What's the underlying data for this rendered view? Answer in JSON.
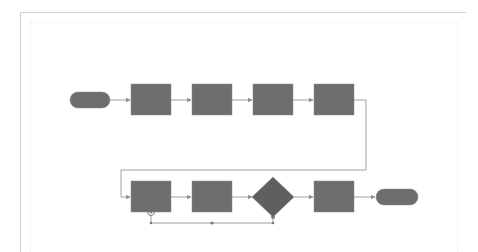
{
  "canvas": {
    "width": 478,
    "height": 243,
    "background": "#ffffff"
  },
  "colors": {
    "shape_fill": "#6e6e6e",
    "shape_stroke": "#8a8a8a",
    "connector": "#a0a0a0",
    "frame": "#cfcfcf",
    "handle": "#7a7a7a"
  },
  "diagram": {
    "type": "flowchart",
    "rows": [
      {
        "name": "row-1",
        "shapes": [
          {
            "id": "start",
            "kind": "terminator",
            "label": ""
          },
          {
            "id": "process-1",
            "kind": "process",
            "label": ""
          },
          {
            "id": "process-2",
            "kind": "process",
            "label": ""
          },
          {
            "id": "process-3",
            "kind": "process",
            "label": ""
          },
          {
            "id": "process-4",
            "kind": "process",
            "label": ""
          }
        ]
      },
      {
        "name": "row-2",
        "shapes": [
          {
            "id": "process-5",
            "kind": "process",
            "label": ""
          },
          {
            "id": "process-6",
            "kind": "process",
            "label": ""
          },
          {
            "id": "decision-1",
            "kind": "decision",
            "label": ""
          },
          {
            "id": "process-7",
            "kind": "process",
            "label": ""
          },
          {
            "id": "end",
            "kind": "terminator",
            "label": ""
          }
        ]
      }
    ],
    "connectors": [
      {
        "from": "start",
        "to": "process-1"
      },
      {
        "from": "process-1",
        "to": "process-2"
      },
      {
        "from": "process-2",
        "to": "process-3"
      },
      {
        "from": "process-3",
        "to": "process-4"
      },
      {
        "from": "process-4",
        "to": "process-5",
        "routing": "elbow"
      },
      {
        "from": "process-5",
        "to": "process-6"
      },
      {
        "from": "process-6",
        "to": "decision-1"
      },
      {
        "from": "decision-1",
        "to": "process-7"
      },
      {
        "from": "process-7",
        "to": "end"
      },
      {
        "from": "process-5",
        "to": "decision-1",
        "routing": "elbow",
        "selected": true
      }
    ]
  }
}
